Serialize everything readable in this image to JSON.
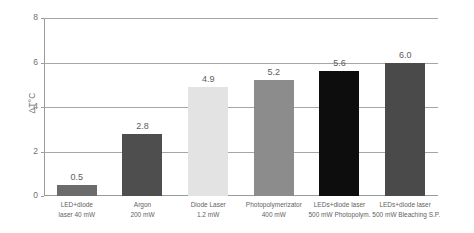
{
  "chart_data": {
    "type": "bar",
    "title": "",
    "xlabel": "",
    "ylabel": "ΔT°C",
    "ylim": [
      0,
      8
    ],
    "yticks": [
      "0",
      "2",
      "4",
      "6",
      "8"
    ],
    "grid": true,
    "legend": "none",
    "categories": [
      "LED+diode laser 40 mW",
      "Argon 200 mW",
      "Diode Laser 1.2 mW",
      "Photopolymerizator 400 mW",
      "LEDs+diode laser 500 mW Photopolym.",
      "LEDs+diode laser 500 mW Bleaching S.P."
    ],
    "category_lines": [
      [
        "LED+diode",
        "laser 40 mW"
      ],
      [
        "Argon",
        "200 mW"
      ],
      [
        "Diode Laser",
        "1.2 mW"
      ],
      [
        "Photopolymerizator",
        "400 mW"
      ],
      [
        "LEDs+diode laser",
        "500 mW Photopolym."
      ],
      [
        "LEDs+diode laser",
        "500 mW Bleaching S.P."
      ]
    ],
    "values": [
      0.5,
      2.8,
      4.9,
      5.2,
      5.6,
      6.0
    ],
    "value_labels": [
      "0.5",
      "2.8",
      "4.9",
      "5.2",
      "5.6",
      "6.0"
    ],
    "bar_colors": [
      "#6b6b6b",
      "#4e4e4e",
      "#e3e3e3",
      "#8c8c8c",
      "#0d0d0d",
      "#4a4a4a"
    ]
  },
  "axis": {
    "y_label": "ΔT°C",
    "ticks": [
      {
        "label": "8",
        "value": 8
      },
      {
        "label": "6",
        "value": 6
      },
      {
        "label": "4",
        "value": 4
      },
      {
        "label": "2",
        "value": 2
      },
      {
        "label": "0",
        "value": 0
      }
    ]
  },
  "colors": {
    "grid": "#a6a6a6",
    "axis": "#9a9a9a",
    "tick_text": "#707070",
    "value_text": "#5d5d5d",
    "category_text": "#5f5f5f",
    "background": "#ffffff"
  },
  "margin_note": {
    "lines": [
      "",
      "",
      "",
      ""
    ]
  }
}
